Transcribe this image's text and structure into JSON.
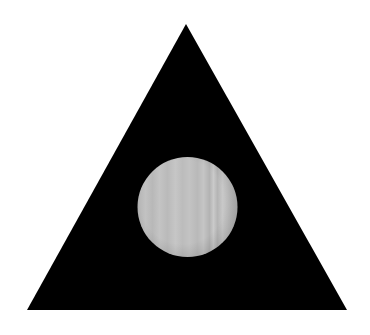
{
  "figure": {
    "background": "#ffffff",
    "triangle": {
      "shape": "equilateral-triangle",
      "fill": "#000000",
      "points": [
        [
          186,
          24
        ],
        [
          347,
          310
        ],
        [
          27,
          310
        ]
      ]
    },
    "circle": {
      "shape": "circle",
      "fill": "#bdbdbd",
      "texture": "vertical-wood-grain",
      "center": [
        187.5,
        207
      ],
      "radius": 50
    }
  }
}
